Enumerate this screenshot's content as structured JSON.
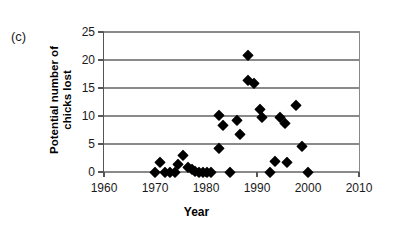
{
  "panel": {
    "label": "(c)"
  },
  "axis_titles": {
    "y": "Potential number of\nchicks lost",
    "x": "Year"
  },
  "chart_data": {
    "type": "scatter",
    "title": "",
    "subtitle": "",
    "xlabel": "Year",
    "ylabel": "Potential number of chicks lost",
    "xlim": [
      1960,
      2010
    ],
    "ylim": [
      0,
      25
    ],
    "xticks": [
      1960,
      1970,
      1980,
      1990,
      2000,
      2010
    ],
    "yticks": [
      0,
      5,
      10,
      15,
      20,
      25
    ],
    "xtick_labels": [
      "1960",
      "1970",
      "1980",
      "1990",
      "2000",
      "2010"
    ],
    "ytick_labels": [
      "0",
      "5",
      "10",
      "15",
      "20",
      "25"
    ],
    "grid": "horizontal",
    "legend": "none",
    "marker": "filled-diamond",
    "marker_color": "#000000",
    "series": [
      {
        "name": "Potential number of chicks lost",
        "points": [
          {
            "x": 1970.0,
            "y": 0.0
          },
          {
            "x": 1971.0,
            "y": 1.7
          },
          {
            "x": 1972.0,
            "y": 0.0
          },
          {
            "x": 1973.0,
            "y": 0.0
          },
          {
            "x": 1974.0,
            "y": 0.0
          },
          {
            "x": 1974.6,
            "y": 1.4
          },
          {
            "x": 1975.4,
            "y": 3.0
          },
          {
            "x": 1976.5,
            "y": 0.9
          },
          {
            "x": 1977.2,
            "y": 0.6
          },
          {
            "x": 1977.8,
            "y": 0.2
          },
          {
            "x": 1978.6,
            "y": 0.0
          },
          {
            "x": 1979.4,
            "y": 0.0
          },
          {
            "x": 1980.2,
            "y": 0.0
          },
          {
            "x": 1981.0,
            "y": 0.0
          },
          {
            "x": 1982.6,
            "y": 10.2
          },
          {
            "x": 1982.6,
            "y": 4.2
          },
          {
            "x": 1983.4,
            "y": 8.4
          },
          {
            "x": 1984.8,
            "y": 0.0
          },
          {
            "x": 1986.0,
            "y": 9.3
          },
          {
            "x": 1986.6,
            "y": 6.7
          },
          {
            "x": 1988.2,
            "y": 20.9
          },
          {
            "x": 1988.2,
            "y": 16.4
          },
          {
            "x": 1989.4,
            "y": 15.9
          },
          {
            "x": 1990.6,
            "y": 11.3
          },
          {
            "x": 1991.0,
            "y": 9.8
          },
          {
            "x": 1992.6,
            "y": 0.0
          },
          {
            "x": 1993.6,
            "y": 1.9
          },
          {
            "x": 1994.6,
            "y": 9.9
          },
          {
            "x": 1995.4,
            "y": 8.7
          },
          {
            "x": 1995.8,
            "y": 1.7
          },
          {
            "x": 1997.6,
            "y": 11.9
          },
          {
            "x": 1998.8,
            "y": 4.7
          },
          {
            "x": 2000.0,
            "y": 0.0
          }
        ]
      }
    ]
  }
}
